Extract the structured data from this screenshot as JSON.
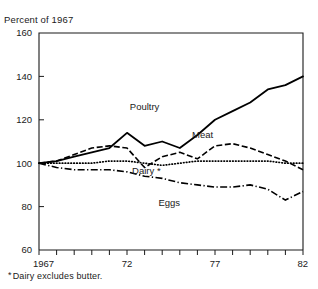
{
  "figure": {
    "clipped_title": "",
    "axis_unit_label": "Percent of 1967",
    "footnote_marker": "*",
    "footnote_text": "Dairy excludes butter."
  },
  "chart_data": {
    "type": "line",
    "title": "",
    "xlabel": "",
    "ylabel": "Percent of 1967",
    "xlim": [
      1967,
      1982
    ],
    "ylim": [
      60,
      160
    ],
    "ytick_values": [
      60,
      80,
      100,
      120,
      140,
      160
    ],
    "ytick_labels": [
      "60",
      "80",
      "100",
      "120",
      "140",
      "160"
    ],
    "xtick_values": [
      1967,
      1968,
      1969,
      1970,
      1971,
      1972,
      1973,
      1974,
      1975,
      1976,
      1977,
      1978,
      1979,
      1980,
      1981,
      1982
    ],
    "xtick_labels": [
      "1967",
      "",
      "",
      "",
      "",
      "72",
      "",
      "",
      "",
      "",
      "77",
      "",
      "",
      "",
      "",
      "82"
    ],
    "grid": false,
    "legend_position": "inline-annotations",
    "x": [
      1967,
      1968,
      1969,
      1970,
      1971,
      1972,
      1973,
      1974,
      1975,
      1976,
      1977,
      1978,
      1979,
      1980,
      1981,
      1982
    ],
    "series": [
      {
        "name": "Poultry",
        "style": "solid",
        "label_x": 1973.0,
        "label_y": 124.5,
        "values": [
          100,
          101,
          103,
          105,
          107,
          114,
          108,
          110,
          107,
          113,
          120,
          124,
          128,
          134,
          136,
          140
        ]
      },
      {
        "name": "Meat",
        "style": "dashed",
        "label_x": 1976.3,
        "label_y": 111.5,
        "values": [
          100,
          101,
          104,
          107,
          108,
          107,
          98,
          103,
          105,
          102,
          108,
          109,
          107,
          104,
          101,
          97
        ]
      },
      {
        "name": "Dairy",
        "style": "dotted",
        "label_x": 1973.1,
        "label_y": 95.0,
        "label_suffix": "*",
        "values": [
          100,
          100,
          100,
          100,
          101,
          101,
          100,
          99,
          100,
          101,
          101,
          101,
          101,
          101,
          100,
          100
        ]
      },
      {
        "name": "Eggs",
        "style": "dash-dot",
        "label_x": 1974.4,
        "label_y": 80.5,
        "values": [
          100,
          98,
          97,
          97,
          97,
          96,
          94,
          93,
          91,
          90,
          89,
          89,
          90,
          88,
          83,
          87
        ]
      }
    ],
    "annotations": [
      {
        "text": "*Dairy excludes butter.",
        "position": "below-axis-left"
      }
    ]
  }
}
